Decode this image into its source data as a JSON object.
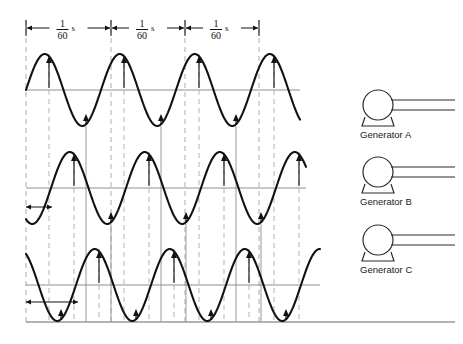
{
  "figure": {
    "background": "#ffffff",
    "wave_color": "#111111",
    "axis_color": "#8f8f8f",
    "guide_color": "#b4b4b4"
  },
  "timing": {
    "segments": [
      {
        "numerator": "1",
        "denominator": "60",
        "unit": "s"
      },
      {
        "numerator": "1",
        "denominator": "60",
        "unit": "s"
      },
      {
        "numerator": "1",
        "denominator": "60",
        "unit": "s"
      }
    ],
    "boundaries_px": [
      26,
      111,
      185,
      259
    ],
    "dim_y": 28
  },
  "generators": [
    {
      "label": "Generator A",
      "cx": 378,
      "cy": 105
    },
    {
      "label": "Generator B",
      "cx": 378,
      "cy": 172
    },
    {
      "label": "Generator C",
      "cx": 378,
      "cy": 240
    }
  ],
  "chart_data": {
    "type": "line",
    "xlabel": "time",
    "ylabel": "voltage",
    "grid": false,
    "legend": "none",
    "period_px": 75,
    "amplitude_px": 36,
    "x_start_px": 26,
    "x_end_px": 320,
    "series": [
      {
        "name": "Generator A",
        "phase_deg": 0,
        "axis_y_px": 90,
        "x_end_px": 300,
        "peaks_px": [
          49,
          124,
          199,
          274
        ],
        "troughs_px": [
          86,
          161,
          236
        ]
      },
      {
        "name": "Generator B",
        "phase_deg": 120,
        "axis_y_px": 188,
        "x_end_px": 306,
        "peaks_px": [
          74,
          149,
          224,
          299
        ],
        "troughs_px": [
          111,
          186,
          261
        ]
      },
      {
        "name": "Generator C",
        "phase_deg": 240,
        "axis_y_px": 285,
        "x_end_px": 320,
        "peaks_px": [
          99,
          174,
          249
        ],
        "troughs_px": [
          61,
          136,
          211,
          286
        ]
      }
    ],
    "phase_shift_markers": [
      {
        "series": "Generator B",
        "from_px": 26,
        "to_px": 52,
        "y_px": 207
      },
      {
        "series": "Generator C",
        "from_px": 26,
        "to_px": 78,
        "y_px": 302
      }
    ]
  }
}
